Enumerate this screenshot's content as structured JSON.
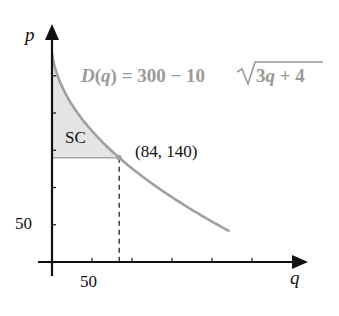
{
  "chart_data": {
    "type": "line",
    "title": "",
    "xlabel": "q",
    "ylabel": "p",
    "function_label": "D(q) = 300 − 10√(3q + 4)",
    "function_parts": {
      "lhs": "D(q) = 300 − 10",
      "radicand": "3q + 4"
    },
    "x_tick_labels": [
      {
        "value": 50,
        "label": "50"
      }
    ],
    "y_tick_labels": [
      {
        "value": 50,
        "label": "50"
      }
    ],
    "x_ticks": [
      50,
      100,
      150,
      200,
      250
    ],
    "y_ticks": [
      50,
      100,
      150,
      200,
      250
    ],
    "xlim": [
      0,
      320
    ],
    "ylim": [
      0,
      320
    ],
    "grid": false,
    "series": [
      {
        "name": "D(q)",
        "q_range": [
          0,
          222
        ],
        "x": [
          0,
          20,
          40,
          60,
          84,
          100,
          120,
          140,
          160,
          180,
          200,
          222
        ],
        "values": [
          280,
          220.5,
          188.1,
          162.6,
          140,
          126.8,
          111.0,
          96.5,
          83.0,
          70.3,
          58.3,
          41.2
        ],
        "color": "#a0a0a0"
      }
    ],
    "annotations": [
      {
        "type": "point",
        "x": 84,
        "y": 140,
        "label": "(84, 140)"
      },
      {
        "type": "shaded_region",
        "label": "SC",
        "description": "consumer surplus between curve and p = 140 for 0 ≤ q ≤ 84",
        "color": "#e4e4e4"
      },
      {
        "type": "dashed_vertical",
        "x": 84,
        "from_y": 0,
        "to_y": 140
      },
      {
        "type": "horizontal_line",
        "y": 140,
        "from_x": 0,
        "to_x": 84
      }
    ]
  },
  "labels": {
    "p_axis": "p",
    "q_axis": "q",
    "x_tick_50": "50",
    "y_tick_50": "50",
    "region": "SC",
    "point": "(84, 140)",
    "formula_lhs": "D(q) = 300 − 10",
    "formula_radicand": "3q + 4"
  },
  "colors": {
    "axis": "#111111",
    "curve": "#a0a0a0",
    "fill": "#e4e4e4",
    "formula": "#9a9a9a",
    "text": "#111111"
  }
}
